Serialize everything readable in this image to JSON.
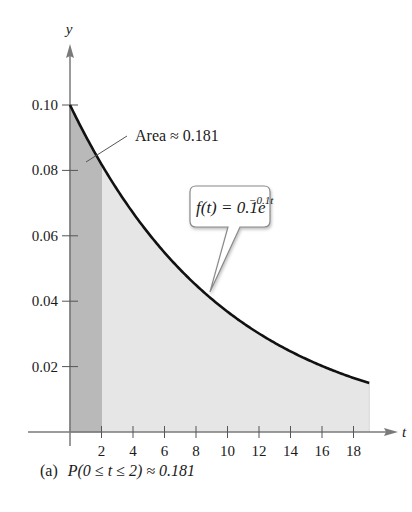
{
  "chart_data": {
    "type": "area",
    "title": "",
    "xlabel": "t",
    "ylabel": "y",
    "xlim": [
      0,
      19.5
    ],
    "ylim": [
      0,
      0.105
    ],
    "x_ticks": [
      2,
      4,
      6,
      8,
      10,
      12,
      14,
      16,
      18
    ],
    "x_tick_labels": [
      "2",
      "4",
      "6",
      "8",
      "10",
      "12",
      "14",
      "16",
      "18"
    ],
    "y_ticks": [
      0.02,
      0.04,
      0.06,
      0.08,
      0.1
    ],
    "y_tick_labels": [
      "0.02",
      "0.04",
      "0.06",
      "0.08",
      "0.10"
    ],
    "grid": false,
    "legend": "none",
    "series": [
      {
        "name": "f(t) = 0.1e^(-0.1t)",
        "function": "0.1*exp(-0.1*t)",
        "domain": [
          0,
          19
        ],
        "x": [
          0,
          2,
          4,
          6,
          8,
          10,
          12,
          14,
          16,
          18,
          19
        ],
        "values": [
          0.1,
          0.0819,
          0.067,
          0.0549,
          0.0449,
          0.0368,
          0.0301,
          0.0247,
          0.0202,
          0.0165,
          0.015
        ]
      }
    ],
    "shaded_regions": [
      {
        "name": "P(0 ≤ t ≤ 2)",
        "from": 0,
        "to": 2,
        "fill": "#b9b9b9",
        "area": 0.181
      },
      {
        "name": "remaining area under curve",
        "from": 2,
        "to": 19,
        "fill": "#e6e6e6"
      }
    ],
    "annotations": [
      {
        "text": "Area ≈ 0.181",
        "points_to": [
          1.2,
          0.075
        ]
      },
      {
        "text": "f(t) = 0.1e^{-0.1t}",
        "points_to": [
          8.7,
          0.042
        ],
        "style": "callout-box"
      }
    ]
  },
  "labels": {
    "y_axis": "y",
    "x_axis": "t",
    "area_annotation": "Area ≈ 0.181",
    "function_callout_main": "f(t) = 0.1e",
    "function_callout_exp": "−0.1t",
    "caption_prefix": "(a)",
    "caption_body": "P(0 ≤ t ≤ 2) ≈ 0.181"
  },
  "colors": {
    "curve": "#111111",
    "axis": "#7a7a7a",
    "dark_shade": "#b9b9b9",
    "light_shade": "#e6e6e6",
    "callout_border": "#8a8a8a"
  }
}
